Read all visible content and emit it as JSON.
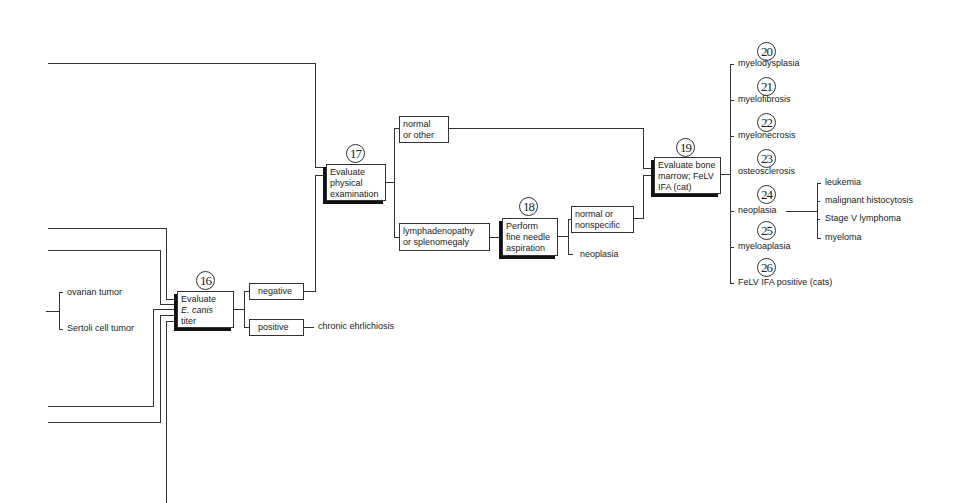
{
  "nodes": {
    "n16": {
      "number": "16",
      "line1": "Evaluate",
      "line2_italic": "E. canis",
      "line3": "titer"
    },
    "n17": {
      "number": "17",
      "lines": [
        "Evaluate",
        "physical",
        "examination"
      ]
    },
    "n18": {
      "number": "18",
      "lines": [
        "Perform",
        "fine needle",
        "aspiration"
      ]
    },
    "n19": {
      "number": "19",
      "lines": [
        "Evaluate bone",
        "marrow; FeLV",
        "IFA (cat)"
      ]
    }
  },
  "left_outcomes": [
    "ovarian tumor",
    "Sertoli cell tumor"
  ],
  "titer_results": {
    "negative": "negative",
    "positive": "positive",
    "positive_outcome": "chronic ehrlichiosis"
  },
  "exam_results": {
    "normal": [
      "normal",
      "or other"
    ],
    "abnormal": [
      "lymphadenopathy",
      "or splenomegaly"
    ]
  },
  "fna_results": {
    "normal": [
      "normal or",
      "nonspecific"
    ],
    "neoplasia": "neoplasia"
  },
  "marrow_outcomes": [
    {
      "number": "20",
      "label": "myelodysplasia"
    },
    {
      "number": "21",
      "label": "myelofibrosis"
    },
    {
      "number": "22",
      "label": "myelonecrosis"
    },
    {
      "number": "23",
      "label": "osteosclerosis"
    },
    {
      "number": "24",
      "label": "neoplasia"
    },
    {
      "number": "25",
      "label": "myeloaplasia"
    },
    {
      "number": "26",
      "label": "FeLV IFA positive (cats)"
    }
  ],
  "neoplasia_types": [
    "leukemia",
    "malignant histocytosis",
    "Stage V lymphoma",
    "myeloma"
  ]
}
